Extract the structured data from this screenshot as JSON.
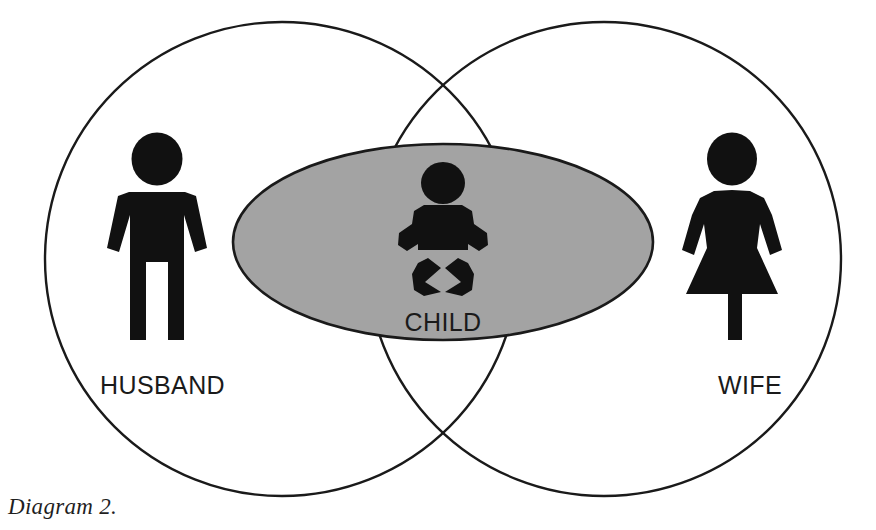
{
  "diagram": {
    "caption": "Diagram 2.",
    "type": "venn",
    "background_color": "#ffffff",
    "stroke_color": "#1a1a1a",
    "figure_color": "#111111",
    "overlap_fill_color": "#a3a3a3",
    "sets": [
      {
        "id": "husband",
        "label": "HUSBAND",
        "shape": "circle",
        "icon": "male-figure-icon",
        "cx": 282,
        "cy": 259,
        "r": 237,
        "label_x": 100,
        "label_y": 394,
        "icon_center_x": 157,
        "icon_center_y": 238
      },
      {
        "id": "wife",
        "label": "WIFE",
        "shape": "circle",
        "icon": "female-figure-icon",
        "cx": 604,
        "cy": 259,
        "r": 237,
        "label_x": 718,
        "label_y": 394,
        "icon_center_x": 732,
        "icon_center_y": 238
      }
    ],
    "intersection": {
      "id": "child",
      "label": "CHILD",
      "shape": "ellipse",
      "icon": "baby-figure-icon",
      "cx": 443,
      "cy": 242,
      "rx": 210,
      "ry": 98,
      "fill": "#a3a3a3",
      "label_x": 443,
      "label_y": 331,
      "icon_center_x": 443,
      "icon_center_y": 228
    }
  }
}
